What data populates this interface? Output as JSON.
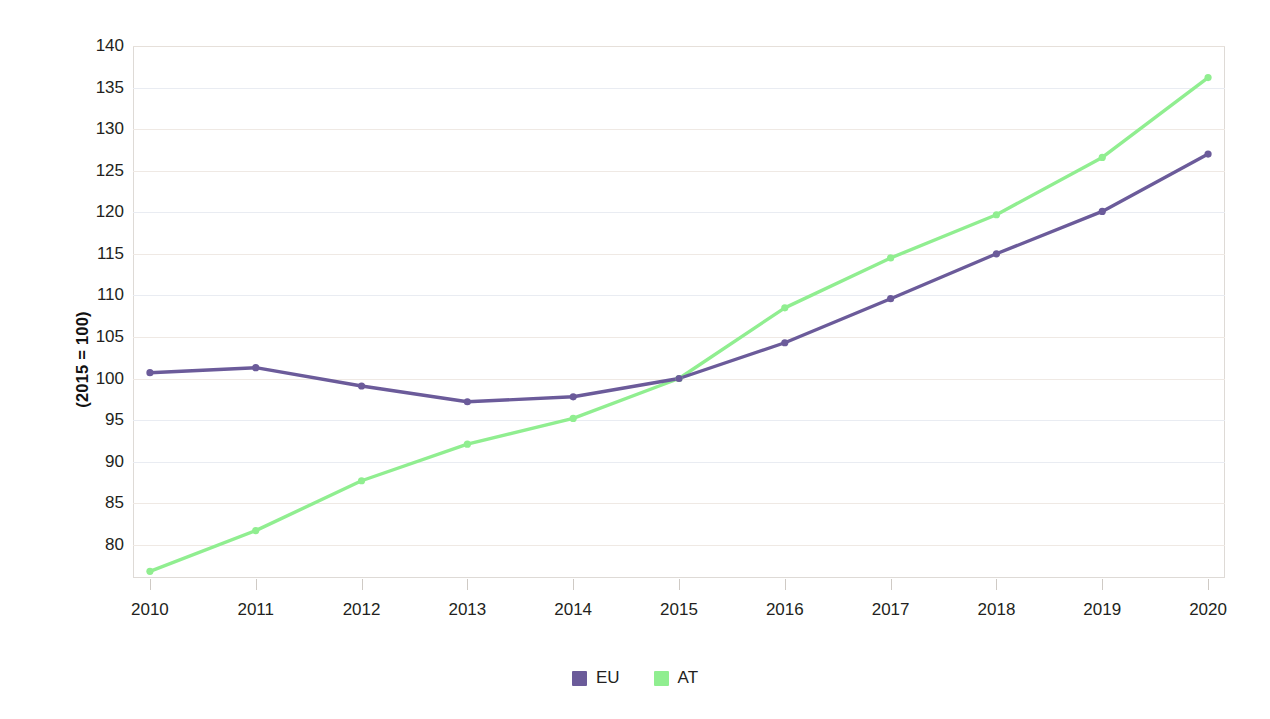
{
  "chart_data": {
    "type": "line",
    "title": "",
    "subtitle": "",
    "xlabel": "",
    "ylabel": "(2015 = 100)",
    "x": [
      "2010",
      "2011",
      "2012",
      "2013",
      "2014",
      "2015",
      "2016",
      "2017",
      "2018",
      "2019",
      "2020"
    ],
    "categories": [
      "2010",
      "2011",
      "2012",
      "2013",
      "2014",
      "2015",
      "2016",
      "2017",
      "2018",
      "2019",
      "2020"
    ],
    "series": [
      {
        "name": "EU",
        "color": "#6B5B9A",
        "values": [
          100.7,
          101.3,
          99.1,
          97.2,
          97.8,
          100.0,
          104.3,
          109.6,
          115.0,
          120.1,
          127.0
        ],
        "markers": true
      },
      {
        "name": "AT",
        "color": "#90EE90",
        "values": [
          76.8,
          81.7,
          87.7,
          92.1,
          95.2,
          100.0,
          108.5,
          114.5,
          119.7,
          126.6,
          136.2
        ],
        "markers": true
      }
    ],
    "ylim": [
      76.0,
      140.0
    ],
    "yticks": [
      80,
      85,
      90,
      95,
      100,
      105,
      110,
      115,
      120,
      125,
      130,
      135,
      140
    ],
    "ytick_labels": [
      "80",
      "85",
      "90",
      "95",
      "100",
      "105",
      "110",
      "115",
      "120",
      "125",
      "130",
      "135",
      "140"
    ],
    "grid": true,
    "grid_axis": "y",
    "legend_position": "bottom",
    "legend": [
      "EU",
      "AT"
    ]
  },
  "axes": {
    "y_title": "(2015 = 100)"
  },
  "legend": {
    "items": [
      {
        "label": "EU",
        "color": "#6B5B9A"
      },
      {
        "label": "AT",
        "color": "#90EE90"
      }
    ]
  }
}
